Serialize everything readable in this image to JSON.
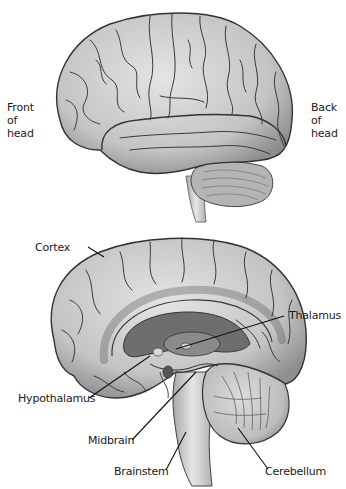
{
  "top_view": {
    "orientation": "lateral",
    "left_label": "Front\nof\nhead",
    "right_label": "Back\nof\nhead"
  },
  "bottom_view": {
    "orientation": "medial-sagittal",
    "labels": {
      "cortex": "Cortex",
      "thalamus": "Thalamus",
      "hypothalamus": "Hypothalamus",
      "midbrain": "Midbrain",
      "brainstem": "Brainstem",
      "cerebellum": "Cerebellum"
    }
  },
  "colors": {
    "tissue": "#c8c8c8",
    "tissue_light": "#dedede",
    "sulci": "#3a3a3a",
    "ventricle": "#6a6a6a",
    "leader_line": "#111111",
    "text": "#1a1a1a"
  }
}
